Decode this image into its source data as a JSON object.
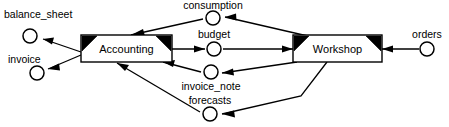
{
  "diagram": {
    "type": "data-flow-diagram",
    "title": "",
    "colors": {
      "background": "#ffffff",
      "stroke": "#000000",
      "box_fill": "#ffffff",
      "corner_marker": "#000000"
    },
    "processes": [
      {
        "id": "accounting",
        "label": "Accounting"
      },
      {
        "id": "workshop",
        "label": "Workshop"
      }
    ],
    "flows": [
      {
        "id": "balance_sheet",
        "label": "balance_sheet"
      },
      {
        "id": "invoice",
        "label": "invoice"
      },
      {
        "id": "consumption",
        "label": "consumption"
      },
      {
        "id": "budget",
        "label": "budget"
      },
      {
        "id": "invoice_note",
        "label": "invoice_note"
      },
      {
        "id": "forecasts",
        "label": "forecasts"
      },
      {
        "id": "orders",
        "label": "orders"
      }
    ],
    "edges": [
      {
        "from": "accounting",
        "to": "balance_sheet"
      },
      {
        "from": "accounting",
        "to": "invoice"
      },
      {
        "from": "workshop",
        "to": "consumption"
      },
      {
        "from": "consumption",
        "to": "accounting"
      },
      {
        "from": "accounting",
        "to": "budget"
      },
      {
        "from": "budget",
        "to": "workshop"
      },
      {
        "from": "workshop",
        "to": "invoice_note"
      },
      {
        "from": "invoice_note",
        "to": "accounting"
      },
      {
        "from": "workshop",
        "to": "forecasts"
      },
      {
        "from": "forecasts",
        "to": "accounting"
      },
      {
        "from": "orders",
        "to": "workshop"
      }
    ]
  }
}
